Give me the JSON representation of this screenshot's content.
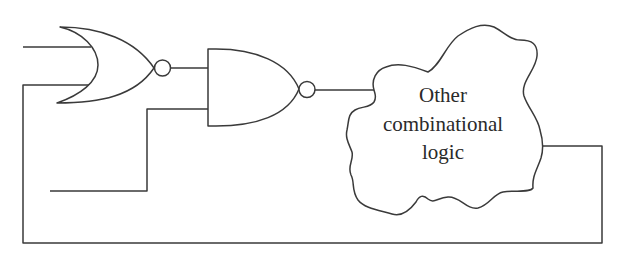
{
  "diagram": {
    "type": "logic-circuit",
    "colors": {
      "stroke": "#3a3a3a",
      "text": "#2a2a2a",
      "background": "#ffffff"
    },
    "components": [
      {
        "id": "nor-gate",
        "kind": "NOR",
        "inputs": 2
      },
      {
        "id": "nand-gate",
        "kind": "NAND",
        "inputs": 2
      },
      {
        "id": "combinational-cloud",
        "kind": "block",
        "label_lines": [
          "Other",
          "combinational",
          "logic"
        ]
      }
    ],
    "cloud": {
      "line1": "Other",
      "line2": "combinational",
      "line3": "logic"
    },
    "connections": [
      "external input -> NOR input 1",
      "feedback loop -> NOR input 2",
      "NOR output -> NAND input 1",
      "external input -> NAND input 2",
      "NAND output -> Other combinational logic",
      "Other combinational logic -> feedback loop"
    ]
  }
}
